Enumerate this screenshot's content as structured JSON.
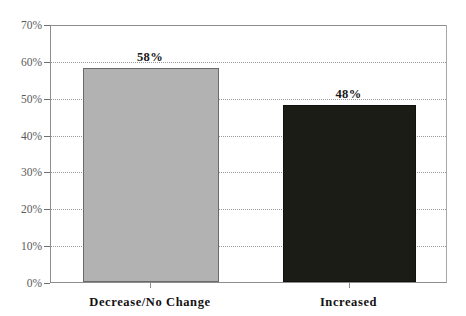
{
  "chart_data": {
    "type": "bar",
    "title": "",
    "subtitle": "",
    "xlabel": "",
    "ylabel": "",
    "categories": [
      "Decrease/No Change",
      "Increased"
    ],
    "values": [
      58,
      48
    ],
    "value_labels": [
      "58%",
      "48%"
    ],
    "ylim": [
      0,
      70
    ],
    "ytick_values": [
      0,
      10,
      20,
      30,
      40,
      50,
      60,
      70
    ],
    "ytick_labels": [
      "0%",
      "10%",
      "20%",
      "30%",
      "40%",
      "50%",
      "60%",
      "70%"
    ],
    "grid": true,
    "grid_style": "dotted-horizontal",
    "legend": false,
    "legend_position": "none",
    "series": [
      {
        "name": "Percentage",
        "values": [
          58,
          48
        ],
        "colors": [
          "#b2b2b2",
          "#1c1c16"
        ]
      }
    ],
    "bar_colors": [
      "#b2b2b2",
      "#1c1c16"
    ],
    "bar_border_colors": [
      "#6a6a6a",
      "#111110"
    ],
    "axis_color": "#8d8d8d",
    "gridline_color": "#9a9a9a",
    "tick_label_color": "#5a5a5a",
    "data_label_color": "#161616",
    "category_label_color": "#121212",
    "background": "#ffffff"
  }
}
